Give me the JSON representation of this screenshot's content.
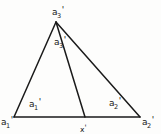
{
  "figure": {
    "kind": "geometry-diagram",
    "background_color": "#fdfdfc",
    "stroke_color": "#1a1a1a",
    "text_color": "#181818",
    "width": 161,
    "height": 134,
    "labels": [
      {
        "id": "vertex-a3",
        "name": "apex-vertex-label",
        "base": "a",
        "subscript": "3",
        "prime": "'",
        "text": "a3'"
      },
      {
        "id": "angle-a3",
        "name": "apex-angle-label",
        "base": "a",
        "subscript": "3",
        "prime": "'",
        "text": "a3'"
      },
      {
        "id": "vertex-a1",
        "name": "left-vertex-label",
        "base": "a",
        "subscript": "1",
        "prime": "'",
        "text": "a1'"
      },
      {
        "id": "angle-a1",
        "name": "left-angle-label",
        "base": "a",
        "subscript": "1",
        "prime": "'",
        "text": "a1'"
      },
      {
        "id": "angle-a2",
        "name": "right-angle-label",
        "base": "a",
        "subscript": "2",
        "prime": "'",
        "text": "a2'"
      },
      {
        "id": "vertex-a2",
        "name": "right-vertex-label",
        "base": "a",
        "subscript": "2",
        "prime": "'",
        "text": "a2'"
      },
      {
        "id": "point-x",
        "name": "base-point-label",
        "base": "x",
        "subscript": "",
        "prime": "'",
        "text": "x'"
      }
    ],
    "points": {
      "apex": {
        "x": 56,
        "y": 22
      },
      "left_vertex": {
        "x": 14,
        "y": 117
      },
      "right_vertex": {
        "x": 140,
        "y": 117
      },
      "base_point": {
        "x": 85,
        "y": 117
      }
    },
    "segments": [
      {
        "name": "left-side",
        "from": "apex",
        "to": "left_vertex"
      },
      {
        "name": "right-side",
        "from": "apex",
        "to": "right_vertex"
      },
      {
        "name": "base",
        "from": "left_vertex",
        "to": "right_vertex"
      },
      {
        "name": "cevian",
        "from": "apex",
        "to": "base_point"
      }
    ]
  }
}
